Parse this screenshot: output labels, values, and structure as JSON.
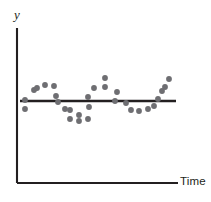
{
  "chart_data": {
    "type": "scatter",
    "title": "",
    "subtitle": "",
    "xlabel": "Time",
    "ylabel": "y",
    "grid": false,
    "legend": null,
    "axis_ticks": {
      "x": [],
      "y": []
    },
    "xlim": [
      0,
      28
    ],
    "ylim": [
      -3,
      3
    ],
    "reference_line": {
      "name": "mean-level-line",
      "orientation": "horizontal",
      "y": 0,
      "color": "#231f20"
    },
    "series": [
      {
        "name": "observations",
        "color": "#6e6e72",
        "marker": "circle",
        "x": [
          1,
          2,
          3,
          4,
          5,
          6,
          7,
          8,
          9,
          10,
          11,
          12,
          13,
          14,
          15,
          16,
          17,
          18,
          19,
          20,
          21,
          22,
          23,
          24,
          25,
          26,
          27,
          28
        ],
        "y": [
          0.0,
          -1.3,
          1.4,
          2.1,
          1.7,
          1.6,
          0.55,
          -0.25,
          -1.1,
          -1.3,
          -2.3,
          -2.6,
          -2.3,
          0.6,
          1.55,
          1.6,
          2.6,
          1.05,
          -0.4,
          1.2,
          0.0,
          -1.25,
          -1.4,
          -1.2,
          -0.8,
          0.45,
          1.1,
          2.5
        ],
        "points_px": [
          {
            "cx": 25,
            "cy": 100
          },
          {
            "cx": 25,
            "cy": 109
          },
          {
            "cx": 34,
            "cy": 90
          },
          {
            "cx": 45,
            "cy": 85
          },
          {
            "cx": 37,
            "cy": 88
          },
          {
            "cx": 54,
            "cy": 86
          },
          {
            "cx": 56,
            "cy": 96
          },
          {
            "cx": 58,
            "cy": 102
          },
          {
            "cx": 65,
            "cy": 109
          },
          {
            "cx": 70,
            "cy": 110
          },
          {
            "cx": 70,
            "cy": 119
          },
          {
            "cx": 79,
            "cy": 121
          },
          {
            "cx": 79,
            "cy": 115
          },
          {
            "cx": 88,
            "cy": 119
          },
          {
            "cx": 88,
            "cy": 97
          },
          {
            "cx": 94,
            "cy": 88
          },
          {
            "cx": 105,
            "cy": 78
          },
          {
            "cx": 105,
            "cy": 87
          },
          {
            "cx": 89,
            "cy": 107
          },
          {
            "cx": 115,
            "cy": 101
          },
          {
            "cx": 117,
            "cy": 92
          },
          {
            "cx": 126,
            "cy": 103
          },
          {
            "cx": 131,
            "cy": 110
          },
          {
            "cx": 139,
            "cy": 111
          },
          {
            "cx": 148,
            "cy": 109
          },
          {
            "cx": 154,
            "cy": 106
          },
          {
            "cx": 158,
            "cy": 99
          },
          {
            "cx": 162,
            "cy": 91
          },
          {
            "cx": 165,
            "cy": 87
          },
          {
            "cx": 169,
            "cy": 79
          }
        ]
      }
    ]
  },
  "axes": {
    "y_label": "y",
    "x_label": "Time",
    "axis_color": "#231f20",
    "y_axis_px": {
      "x": 17,
      "y1": 28,
      "y2": 183
    },
    "x_axis_px": {
      "y": 183,
      "x1": 17,
      "x2": 178
    },
    "trend_line_px": {
      "y": 101,
      "x1": 20,
      "x2": 176
    }
  },
  "colors": {
    "point": "#6e6e72",
    "line": "#231f20",
    "background": "#ffffff"
  }
}
